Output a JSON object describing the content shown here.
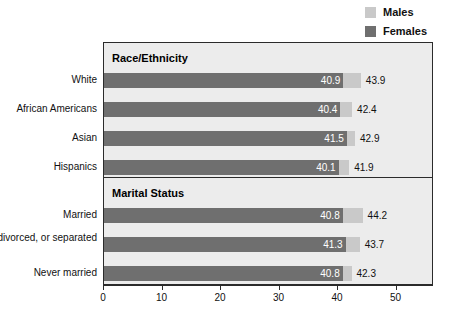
{
  "legend": {
    "items": [
      {
        "label": "Males",
        "color": "#c9c9c9",
        "name": "legend-swatch-males"
      },
      {
        "label": "Females",
        "color": "#6f6f6f",
        "name": "legend-swatch-females"
      }
    ]
  },
  "axis": {
    "ticks": [
      "0",
      "10",
      "20",
      "30",
      "40",
      "50"
    ],
    "tick_values": [
      0,
      10,
      20,
      30,
      40,
      50
    ],
    "min": 0,
    "max": 56.4
  },
  "panels": [
    {
      "title": "Race/Ethnicity",
      "rows": [
        {
          "label": "White",
          "females": "40.9",
          "males": "43.9"
        },
        {
          "label": "African Americans",
          "females": "40.4",
          "males": "42.4"
        },
        {
          "label": "Asian",
          "females": "41.5",
          "males": "42.9"
        },
        {
          "label": "Hispanics",
          "females": "40.1",
          "males": "41.9"
        }
      ]
    },
    {
      "title": "Marital Status",
      "rows": [
        {
          "label": "Married",
          "females": "40.8",
          "males": "44.2"
        },
        {
          "label": "Widowed, divorced, or separated",
          "females": "41.3",
          "males": "43.7"
        },
        {
          "label": "Never married",
          "females": "40.8",
          "males": "42.3"
        }
      ]
    }
  ],
  "chart_data": {
    "type": "bar",
    "orientation": "horizontal",
    "title": "",
    "xlabel": "",
    "ylabel": "",
    "xlim": [
      0,
      56.4
    ],
    "xticks": [
      0,
      10,
      20,
      30,
      40,
      50
    ],
    "grid": false,
    "legend_position": "top-right",
    "groups": [
      {
        "name": "Race/Ethnicity",
        "categories": [
          "White",
          "African Americans",
          "Asian",
          "Hispanics"
        ],
        "series": [
          {
            "name": "Males",
            "color": "#c9c9c9",
            "values": [
              43.9,
              42.4,
              42.9,
              41.9
            ]
          },
          {
            "name": "Females",
            "color": "#6f6f6f",
            "values": [
              40.9,
              40.4,
              41.5,
              40.1
            ]
          }
        ]
      },
      {
        "name": "Marital Status",
        "categories": [
          "Married",
          "Widowed, divorced, or separated",
          "Never married"
        ],
        "series": [
          {
            "name": "Males",
            "color": "#c9c9c9",
            "values": [
              44.2,
              43.7,
              42.3
            ]
          },
          {
            "name": "Females",
            "color": "#6f6f6f",
            "values": [
              40.8,
              41.3,
              40.8
            ]
          }
        ]
      }
    ]
  }
}
